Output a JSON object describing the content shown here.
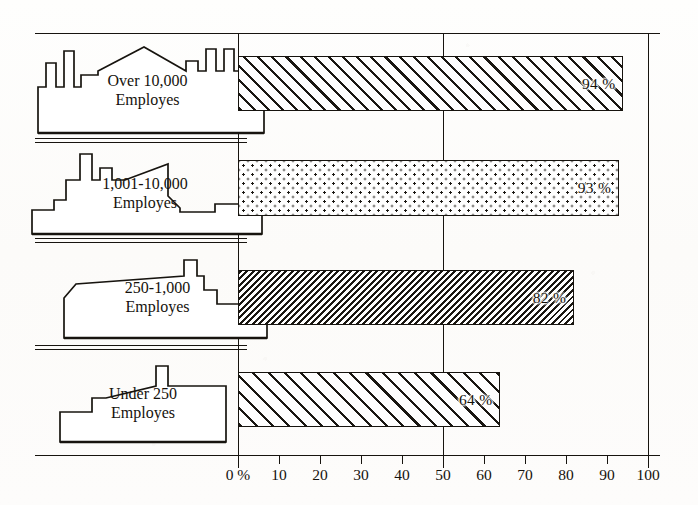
{
  "chart_data": {
    "type": "bar",
    "orientation": "horizontal",
    "title": "",
    "subtitle": "",
    "xlabel": "",
    "ylabel": "",
    "xlim": [
      0,
      100
    ],
    "grid": true,
    "gridlines_at": [
      0,
      50,
      100
    ],
    "legend": "none",
    "value_suffix": "%",
    "categories": [
      "Over 10,000 Employes",
      "1,001-10,000 Employes",
      "250-1,000 Employes",
      "Under 250 Employes"
    ],
    "values": [
      94,
      93,
      82,
      64
    ],
    "data_labels": [
      "94 %",
      "93 %",
      "82 %",
      "64 %"
    ],
    "tick_values": [
      0,
      10,
      20,
      30,
      40,
      50,
      60,
      70,
      80,
      90,
      100
    ],
    "tick_labels": [
      "0 %",
      "10",
      "20",
      "30",
      "40",
      "50",
      "60",
      "70",
      "80",
      "90",
      "100"
    ],
    "fill_patterns": [
      "diagonal-hatch-wide",
      "stipple-dots",
      "diagonal-hatch-dense",
      "diagonal-hatch-medium"
    ]
  },
  "rows": [
    {
      "label_line1": "Over 10,000",
      "label_line2": "Employes",
      "value_label": "94 %",
      "value": 94,
      "icon": "factory-icon"
    },
    {
      "label_line1": "1,001-10,000",
      "label_line2": "Employes",
      "value_label": "93 %",
      "value": 93,
      "icon": "factory-icon"
    },
    {
      "label_line1": "250-1,000",
      "label_line2": "Employes",
      "value_label": "82 %",
      "value": 82,
      "icon": "factory-icon"
    },
    {
      "label_line1": "Under 250",
      "label_line2": "Employes",
      "value_label": "64 %",
      "value": 64,
      "icon": "factory-icon"
    }
  ],
  "axis": {
    "labels": [
      "0 %",
      "10",
      "20",
      "30",
      "40",
      "50",
      "60",
      "70",
      "80",
      "90",
      "100"
    ]
  },
  "colors": {
    "ink": "#17140f",
    "paper": "#fdfdfc"
  }
}
